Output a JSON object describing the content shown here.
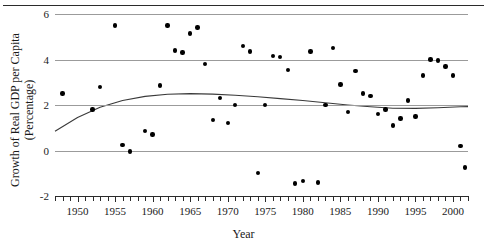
{
  "figure": {
    "top_rule_present": true,
    "background_color": "#ffffff",
    "point_color": "#000000",
    "gridline_color": "#9b9b9b",
    "axis_color": "#2b2b2b",
    "curve_color": "#3a3a3a"
  },
  "axis_titles": {
    "x": "Year",
    "y_line1": "Growth of Real GDP per Capita",
    "y_line2": "(Percentage)"
  },
  "chart_data": {
    "type": "scatter",
    "title": "",
    "xlabel": "Year",
    "ylabel": "Growth of Real GDP per Capita (Percentage)",
    "xlim": [
      1947,
      2002
    ],
    "ylim": [
      -2,
      6
    ],
    "yticks": [
      -2,
      0,
      2,
      4,
      6
    ],
    "ytick_labels": [
      "-2",
      "0",
      "2",
      "4",
      "6"
    ],
    "xticks": [
      1950,
      1955,
      1960,
      1965,
      1970,
      1975,
      1980,
      1985,
      1990,
      1995,
      2000
    ],
    "xtick_labels": [
      "1950",
      "1955",
      "1960",
      "1965",
      "1970",
      "1975",
      "1980",
      "1985",
      "1990",
      "1995",
      "2000"
    ],
    "xtick_minor_step": 1,
    "grid": "horizontal",
    "legend": "none",
    "x": [
      1948,
      1952,
      1953,
      1955,
      1956,
      1957,
      1959,
      1960,
      1961,
      1962,
      1963,
      1964,
      1965,
      1966,
      1967,
      1968,
      1969,
      1970,
      1971,
      1972,
      1973,
      1974,
      1975,
      1976,
      1977,
      1978,
      1979,
      1980,
      1981,
      1982,
      1983,
      1984,
      1985,
      1986,
      1987,
      1988,
      1989,
      1990,
      1991,
      1992,
      1993,
      1994,
      1995,
      1996,
      1997,
      1998,
      1999,
      2000,
      2001
    ],
    "y": [
      2.5,
      1.8,
      2.8,
      5.5,
      0.25,
      -0.05,
      0.85,
      0.7,
      2.85,
      5.5,
      4.4,
      4.3,
      5.15,
      5.4,
      3.8,
      1.35,
      2.3,
      1.2,
      2.0,
      4.6,
      4.35,
      -1.0,
      2.0,
      4.15,
      4.1,
      3.55,
      -1.45,
      -1.35,
      4.35,
      -1.4,
      2.0,
      4.5,
      2.9,
      1.7,
      3.5,
      2.5,
      2.4,
      1.6,
      1.8,
      1.1,
      1.4,
      2.2,
      1.5,
      3.3,
      4.0,
      3.95,
      3.7,
      3.3,
      0.2
    ],
    "fit_curve": {
      "label": "smoothed trend",
      "x": [
        1947,
        1950,
        1953,
        1956,
        1959,
        1962,
        1965,
        1968,
        1971,
        1974,
        1977,
        1980,
        1983,
        1986,
        1989,
        1992,
        1995,
        1998,
        2001,
        2002
      ],
      "y": [
        0.85,
        1.45,
        1.9,
        2.2,
        2.38,
        2.47,
        2.5,
        2.48,
        2.43,
        2.36,
        2.28,
        2.2,
        2.1,
        2.0,
        1.92,
        1.86,
        1.85,
        1.88,
        1.92,
        1.93
      ]
    },
    "extra_point_near_2001": -0.75
  }
}
